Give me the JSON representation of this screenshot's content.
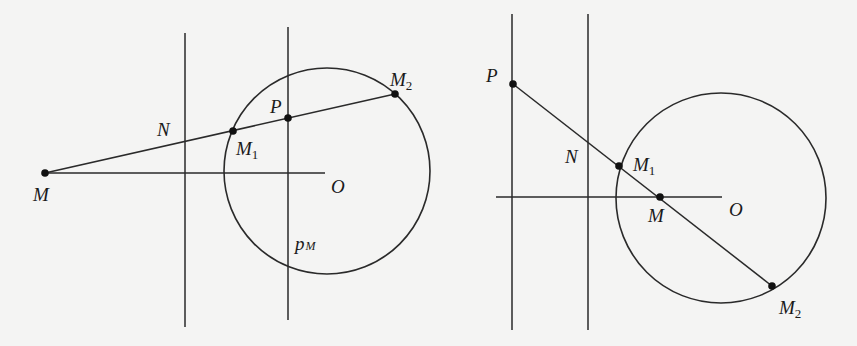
{
  "figure": {
    "left_panel": {
      "labels": {
        "M": "M",
        "N": "N",
        "M1_base": "M",
        "M1_sub": "1",
        "P": "P",
        "M2_base": "M",
        "M2_sub": "2",
        "O": "O",
        "pM_base": "p",
        "pM_sub": "M"
      }
    },
    "right_panel": {
      "labels": {
        "P": "P",
        "N": "N",
        "M1_base": "M",
        "M1_sub": "1",
        "M": "M",
        "O": "O",
        "M2_base": "M",
        "M2_sub": "2"
      }
    },
    "colors": {
      "background": "#f4f4f3",
      "stroke": "#2a2a2a",
      "point": "#111111"
    }
  }
}
